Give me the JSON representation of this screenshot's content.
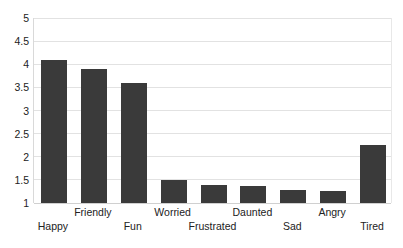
{
  "chart_data": {
    "type": "bar",
    "title": "",
    "subtitle": "",
    "xlabel": "",
    "ylabel": "",
    "categories": [
      "Happy",
      "Friendly",
      "Fun",
      "Worried",
      "Frustrated",
      "Daunted",
      "Sad",
      "Angry",
      "Tired"
    ],
    "values": [
      4.1,
      3.9,
      3.6,
      1.49,
      1.4,
      1.36,
      1.29,
      1.26,
      2.25
    ],
    "series": [
      {
        "name": "",
        "values": [
          4.1,
          3.9,
          3.6,
          1.49,
          1.4,
          1.36,
          1.29,
          1.26,
          2.25
        ]
      }
    ],
    "ylim": [
      1,
      5
    ],
    "ytick_step": 0.5,
    "ytick_labels": [
      "5",
      "4.5",
      "4",
      "3.5",
      "3",
      "2.5",
      "2",
      "1.5",
      "1"
    ],
    "ytick_values": [
      5,
      4.5,
      4,
      3.5,
      3,
      2.5,
      2,
      1.5,
      1
    ],
    "grid": true,
    "grid_axis": "y",
    "legend": false,
    "legend_position": "none",
    "label_stagger": [
      "bottom",
      "top",
      "bottom",
      "top",
      "bottom",
      "top",
      "bottom",
      "top",
      "bottom"
    ],
    "annotations": []
  },
  "style": {
    "bar_color": "#3a3a3a",
    "grid_color": "#e2e2e2",
    "axis_color": "#d0d0d0",
    "background": "#ffffff",
    "text_color": "#222222"
  }
}
